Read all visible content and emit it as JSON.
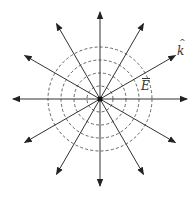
{
  "diagram": {
    "title": "",
    "center": {
      "x": 100,
      "y": 99
    },
    "arrow_length": 87,
    "arrow_angles_deg": [
      0,
      30,
      60,
      90,
      120,
      150,
      180,
      210,
      240,
      270,
      300,
      330
    ],
    "circle_radii": [
      13,
      26,
      39,
      52
    ],
    "colors": {
      "line": "#333333",
      "dashed_circle": "#555555",
      "background": "#ffffff"
    },
    "labels": {
      "field": {
        "text": "E",
        "accent": "bar",
        "x": 141,
        "y": 80
      },
      "wavevector": {
        "text": "k",
        "accent": "hat",
        "x": 177,
        "y": 45
      }
    }
  }
}
